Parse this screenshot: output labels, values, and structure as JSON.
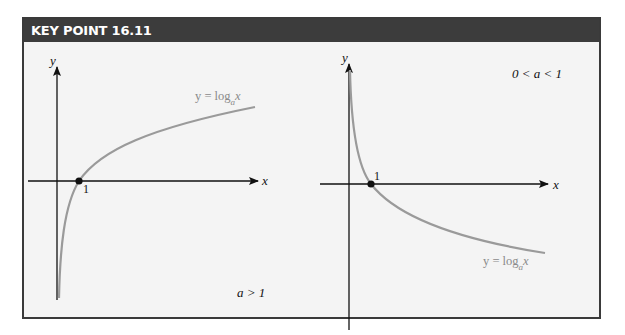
{
  "header": {
    "title": "KEY POINT 16.11"
  },
  "graphs": [
    {
      "id": "a-greater-than-1",
      "x_axis_label": "x",
      "y_axis_label": "y",
      "intercept_label": "1",
      "curve_label": {
        "lhs": "y = log",
        "sub": "a",
        "rhs": "x"
      },
      "condition": "a > 1"
    },
    {
      "id": "a-between-0-and-1",
      "x_axis_label": "x",
      "y_axis_label": "y",
      "intercept_label": "1",
      "curve_label": {
        "lhs": "y = log",
        "sub": "a",
        "rhs": "x"
      },
      "condition": "0 < a < 1"
    }
  ],
  "colors": {
    "header_bg": "#3c3c3c",
    "panel_bg": "#f4f4f4",
    "axis": "#111111",
    "curve": "#9a9a9a",
    "curve_label": "#8a8a8a"
  }
}
